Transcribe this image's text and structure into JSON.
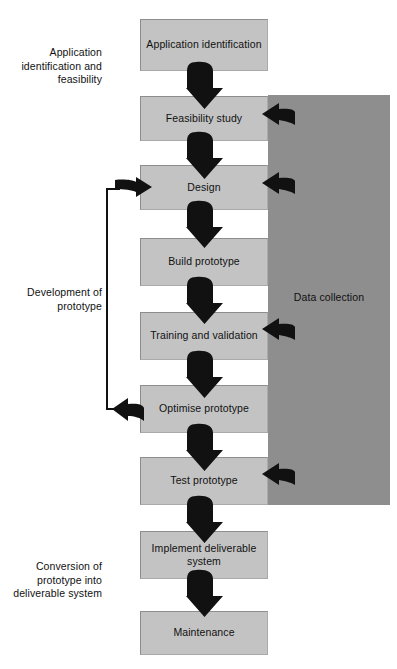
{
  "diagram": {
    "colors": {
      "box_fill": "#c3c3c3",
      "box_edge": "#8d8d8d",
      "band_fill": "#8e8e8e",
      "arrow_fill": "#111111",
      "page_bg": "#ffffff",
      "text": "#111111"
    },
    "band": {
      "label": "Data collection"
    },
    "stage_labels": [
      {
        "id": "stage-application",
        "text": "Application identification and feasibility"
      },
      {
        "id": "stage-development",
        "text": "Development of prototype"
      },
      {
        "id": "stage-conversion",
        "text": "Conversion of prototype into deliverable system"
      }
    ],
    "nodes": [
      {
        "id": "application-identification",
        "label": "Application identification"
      },
      {
        "id": "feasibility-study",
        "label": "Feasibility study"
      },
      {
        "id": "design",
        "label": "Design"
      },
      {
        "id": "build-prototype",
        "label": "Build prototype"
      },
      {
        "id": "training-and-validation",
        "label": "Training and validation"
      },
      {
        "id": "optimise-prototype",
        "label": "Optimise prototype"
      },
      {
        "id": "test-prototype",
        "label": "Test prototype"
      },
      {
        "id": "implement-deliverable-system",
        "label": "Implement deliverable system"
      },
      {
        "id": "maintenance",
        "label": "Maintenance"
      }
    ],
    "flow_arrows": [
      {
        "from": "application-identification",
        "to": "feasibility-study",
        "direction": "down"
      },
      {
        "from": "feasibility-study",
        "to": "design",
        "direction": "down"
      },
      {
        "from": "design",
        "to": "build-prototype",
        "direction": "down"
      },
      {
        "from": "build-prototype",
        "to": "training-and-validation",
        "direction": "down"
      },
      {
        "from": "training-and-validation",
        "to": "optimise-prototype",
        "direction": "down"
      },
      {
        "from": "optimise-prototype",
        "to": "test-prototype",
        "direction": "down"
      },
      {
        "from": "test-prototype",
        "to": "implement-deliverable-system",
        "direction": "down"
      },
      {
        "from": "implement-deliverable-system",
        "to": "maintenance",
        "direction": "down"
      }
    ],
    "data_arrows": [
      {
        "from": "Data collection",
        "to": "feasibility-study",
        "direction": "left"
      },
      {
        "from": "Data collection",
        "to": "design",
        "direction": "left"
      },
      {
        "from": "Data collection",
        "to": "training-and-validation",
        "direction": "left"
      },
      {
        "from": "Data collection",
        "to": "test-prototype",
        "direction": "left"
      }
    ],
    "feedback_loop": {
      "from": "optimise-prototype",
      "to": "design",
      "description": "Optimise prototype loops back to Design"
    }
  }
}
